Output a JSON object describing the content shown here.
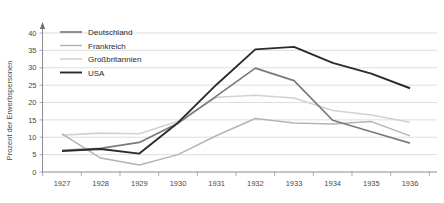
{
  "chart_data": {
    "type": "line",
    "title": "",
    "xlabel": "",
    "ylabel": "Prozent der Erwerbspersonen",
    "categories": [
      "1927",
      "1928",
      "1929",
      "1930",
      "1931",
      "1932",
      "1933",
      "1934",
      "1935",
      "1936"
    ],
    "x": [
      1927,
      1928,
      1929,
      1930,
      1931,
      1932,
      1933,
      1934,
      1935,
      1936
    ],
    "ylim": [
      0,
      40
    ],
    "yticks": [
      0,
      5,
      10,
      15,
      20,
      25,
      30,
      35,
      40
    ],
    "ytick_labels": [
      "0",
      "5",
      "10",
      "15",
      "20",
      "25",
      "30",
      "35",
      "40"
    ],
    "grid": true,
    "legend_position": "top-left",
    "series": [
      {
        "name": "Deutschland",
        "color": "#7a7a7a",
        "width": 1.7,
        "values": [
          6.2,
          6.8,
          8.5,
          14.0,
          21.9,
          29.9,
          26.3,
          14.9,
          11.6,
          8.3
        ]
      },
      {
        "name": "Frankreich",
        "color": "#b4b4b4",
        "width": 1.5,
        "values": [
          11.0,
          4.0,
          2.0,
          5.0,
          10.5,
          15.4,
          14.1,
          13.8,
          14.5,
          10.4
        ]
      },
      {
        "name": "Großbritannien",
        "color": "#d2d2d2",
        "width": 1.6,
        "values": [
          10.6,
          11.2,
          11.0,
          14.6,
          21.5,
          22.1,
          21.3,
          17.7,
          16.4,
          14.3
        ]
      },
      {
        "name": "USA",
        "color": "#2b2b2b",
        "width": 1.9,
        "values": [
          6.0,
          6.6,
          5.3,
          14.2,
          25.2,
          35.3,
          36.0,
          31.4,
          28.3,
          24.1
        ]
      }
    ]
  },
  "legend": {
    "items": [
      {
        "label": "Deutschland"
      },
      {
        "label": "Frankreich"
      },
      {
        "label": "Großbritannien"
      },
      {
        "label": "USA"
      }
    ]
  }
}
